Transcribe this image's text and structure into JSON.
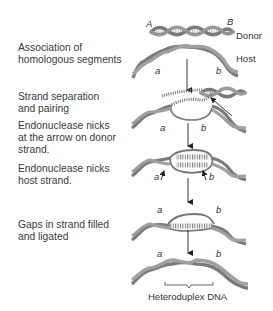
{
  "steps": [
    {
      "label": "Association of homologous segments",
      "lines": [
        "Association of",
        "homologous segments"
      ]
    },
    {
      "label": "Strand separation and pairing",
      "lines": [
        "Strand separation",
        "and pairing"
      ]
    },
    {
      "label": "Endonuclease nicks at the arrow on donor strand.",
      "lines": [
        "Endonuclease nicks",
        "at the arrow on donor",
        "strand."
      ]
    },
    {
      "label": "Endonuclease nicks host strand.",
      "lines": [
        "Endonuclease nicks",
        "host strand."
      ]
    },
    {
      "label": "Gaps in strand filled and ligated",
      "lines": [
        "Gaps in strand filled",
        "and ligated"
      ]
    }
  ],
  "molecules": {
    "donor": {
      "name": "Donor",
      "left_marker": "A",
      "right_marker": "B"
    },
    "host": {
      "name": "Host",
      "left_marker": "a",
      "right_marker": "b"
    }
  },
  "result_label": "Heteroduplex DNA",
  "colors": {
    "helix": "#8a8a8a",
    "text": "#333333",
    "arrow": "#222222"
  }
}
